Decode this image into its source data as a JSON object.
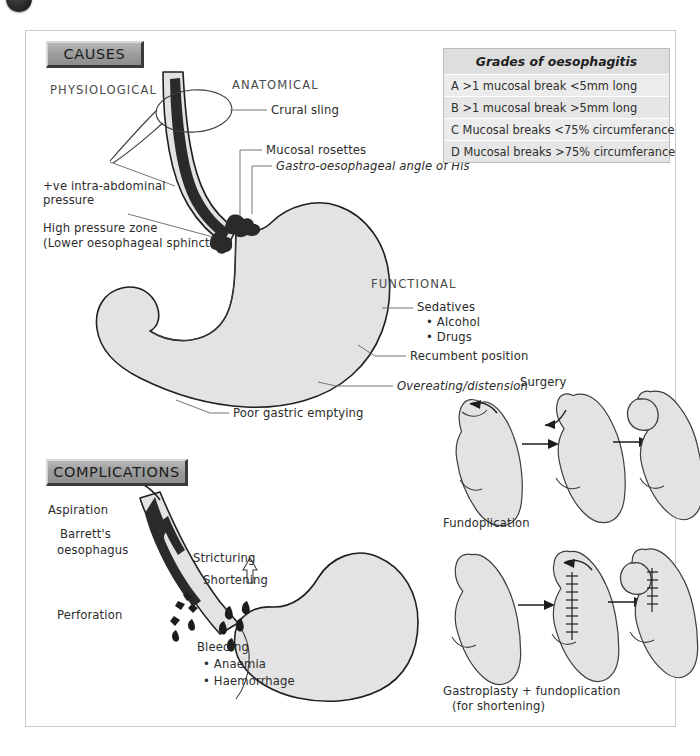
{
  "page": {
    "background": "#ffffff",
    "panel_border_color": "#c9c9c9",
    "organ_fill": "#e3e3e3",
    "organ_stroke": "#1f1f1f",
    "mucosa_color": "#2a2a2a"
  },
  "sections": {
    "causes_header": "CAUSES",
    "complications_header": "COMPLICATIONS"
  },
  "causes": {
    "category_physiological": "PHYSIOLOGICAL",
    "category_anatomical": "ANATOMICAL",
    "category_functional": "FUNCTIONAL",
    "physiological": [
      {
        "line1": "+ve intra-abdominal",
        "line2": "pressure"
      },
      {
        "line1": "High pressure zone",
        "line2": "(Lower oesophageal sphincter)"
      }
    ],
    "anatomical": [
      "Crural sling",
      "Mucosal rosettes",
      "Gastro-oesophageal angle of His"
    ],
    "functional": [
      "Sedatives",
      "• Alcohol",
      "• Drugs",
      "Recumbent position",
      "Overeating/distension",
      "Poor gastric emptying"
    ]
  },
  "complications": {
    "labels": [
      "Aspiration",
      "Barrett's",
      "oesophagus",
      "Stricturing",
      "Shortening",
      "Perforation",
      "Bleeding",
      "• Anaemia",
      "• Haemorrhage"
    ]
  },
  "grades_table": {
    "title": "Grades of oesophagitis",
    "rows": [
      "A >1 mucosal break <5mm long",
      "B >1 mucosal break >5mm long",
      "C Mucosal breaks <75% circumferance",
      "D Mucosal breaks >75% circumferance"
    ]
  },
  "surgery": {
    "title": "Surgery",
    "caption_top": "Fundoplication",
    "caption_bottom_line1": "Gastroplasty + fundoplication",
    "caption_bottom_line2": "(for shortening)"
  }
}
